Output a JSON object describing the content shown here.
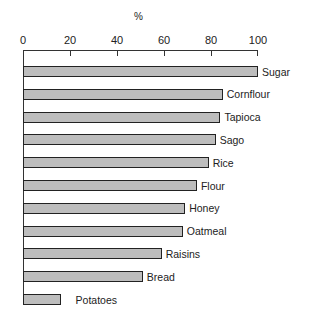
{
  "chart_data": {
    "type": "bar",
    "orientation": "horizontal",
    "title": "",
    "xlabel": "%",
    "ylabel": "",
    "xlim": [
      0,
      100
    ],
    "x_ticks": [
      0,
      20,
      40,
      60,
      80,
      100
    ],
    "x_axis_position": "top",
    "grid": false,
    "legend": null,
    "categories": [
      "Sugar",
      "Cornflour",
      "Tapioca",
      "Sago",
      "Rice",
      "Flour",
      "Honey",
      "Oatmeal",
      "Raisins",
      "Bread",
      "Potatoes"
    ],
    "values": [
      100,
      85,
      84,
      82,
      79,
      74,
      69,
      68,
      59,
      51,
      16
    ]
  },
  "axis": {
    "unit_label": "%",
    "ticks": [
      "0",
      "20",
      "40",
      "60",
      "80",
      "100"
    ]
  },
  "style": {
    "bar_fill": "#bdbdbd",
    "bar_border": "#222222"
  }
}
